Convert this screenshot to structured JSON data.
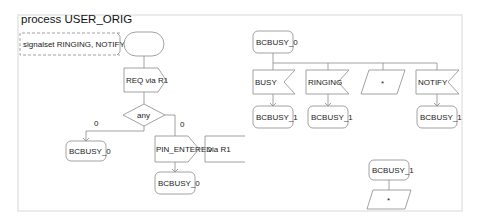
{
  "diagram": {
    "title": "process USER_ORIG",
    "signalset": "signalset RINGING, NOTIFY, BUSY;",
    "left_flow": {
      "start_label": "",
      "output": "REQ via R1",
      "decision": "any",
      "branch_left_label": "0",
      "branch_right_label": "0",
      "state_left": "BCBUSY_0",
      "output2": "PIN_ENTERED",
      "output2_via": "via R1",
      "state_bottom": "BCBUSY_0"
    },
    "right_flow": {
      "state": "BCBUSY_0",
      "inputs": [
        {
          "label": "BUSY",
          "next": "BCBUSY_1"
        },
        {
          "label": "RINGING",
          "next": "BCBUSY_1"
        },
        {
          "label": "*",
          "next": ""
        },
        {
          "label": "NOTIFY",
          "next": "BCBUSY_1"
        }
      ]
    },
    "bottom_right": {
      "state": "BCBUSY_1",
      "save": "*"
    }
  },
  "colors": {
    "stroke": "#8a8a8a",
    "frame": "#d8d8d8",
    "text": "#222222"
  }
}
